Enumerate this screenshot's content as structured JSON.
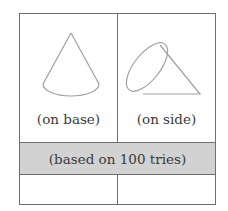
{
  "figure": {
    "cells": [
      {
        "label": "(on base)",
        "shape": "cone-upright"
      },
      {
        "label": "(on side)",
        "shape": "cone-on-side"
      }
    ],
    "band_text": "(based on 100 tries)",
    "bottom_row": [
      "",
      ""
    ],
    "colors": {
      "border": "#6e6e6e",
      "band": "#d2d2d2",
      "shape_stroke": "#a0a0a0"
    }
  }
}
